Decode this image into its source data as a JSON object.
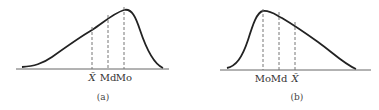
{
  "panels": [
    {
      "id": "a",
      "caption": "(a)",
      "skew": "negative (left-skewed)",
      "markers": [
        {
          "label": "X̄",
          "name": "mean"
        },
        {
          "label": "Md",
          "name": "median"
        },
        {
          "label": "Mo",
          "name": "mode"
        }
      ]
    },
    {
      "id": "b",
      "caption": "(b)",
      "skew": "positive (right-skewed)",
      "markers": [
        {
          "label": "Mo",
          "name": "mode"
        },
        {
          "label": "Md",
          "name": "median"
        },
        {
          "label": "X̄",
          "name": "mean"
        }
      ]
    }
  ],
  "colors": {
    "curve": "#222222",
    "axis": "#555555",
    "dashed": "#777777"
  }
}
